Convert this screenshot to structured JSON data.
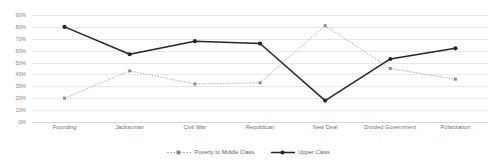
{
  "chart_data": {
    "type": "line",
    "title": "",
    "xlabel": "",
    "ylabel": "",
    "ylim": [
      0,
      90
    ],
    "grid": true,
    "legend_position": "bottom-center",
    "categories": [
      "Founding",
      "Jacksonian",
      "Civil War",
      "Republican",
      "New Deal",
      "Divided Government",
      "Polarization"
    ],
    "y_tick_labels": [
      "90%",
      "80%",
      "70%",
      "60%",
      "50%",
      "40%",
      "30%",
      "20%",
      "10%",
      "0%"
    ],
    "y_tick_values": [
      90,
      80,
      70,
      60,
      50,
      40,
      30,
      20,
      10,
      0
    ],
    "series": [
      {
        "name": "Poverty to Middle Class",
        "color": "#a6a6a6",
        "line_style": "dotted",
        "marker": "square",
        "values": [
          20,
          43,
          32,
          33,
          81,
          45,
          36
        ]
      },
      {
        "name": "Upper Class",
        "color": "#262626",
        "line_style": "solid",
        "marker": "circle",
        "values": [
          80,
          57,
          68,
          66,
          18,
          53,
          62
        ]
      }
    ]
  },
  "legend": {
    "items": [
      {
        "label": "Poverty to Middle Class"
      },
      {
        "label": "Upper Class"
      }
    ]
  },
  "colors": {
    "gridline": "#e8e8e8",
    "baseline": "#d6d6d6",
    "axis_text": "#868686",
    "category_text": "#6f6f6f",
    "legend_text": "#5d5d5d",
    "series_gray": "#a6a6a6",
    "series_black": "#262626",
    "background": "#ffffff"
  }
}
